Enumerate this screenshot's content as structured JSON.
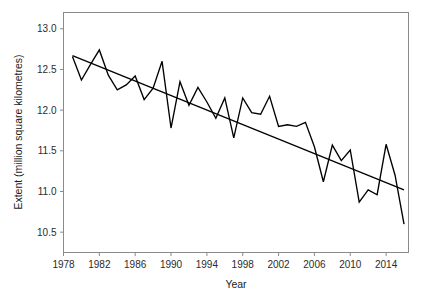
{
  "chart_data": {
    "type": "line",
    "title": "",
    "subtitle": "",
    "xlabel": "Year",
    "ylabel": "Extent (million square kilometres)",
    "xlim": [
      1978,
      2016.5
    ],
    "ylim": [
      10.25,
      13.2
    ],
    "xticks": [
      1978,
      1982,
      1986,
      1990,
      1994,
      1998,
      2002,
      2006,
      2010,
      2014
    ],
    "xtick_labels": [
      "1978",
      "1982",
      "1986",
      "1990",
      "1994",
      "1998",
      "2002",
      "2006",
      "2010",
      "2014"
    ],
    "yticks": [
      10.5,
      11.0,
      11.5,
      12.0,
      12.5,
      13.0
    ],
    "ytick_labels": [
      "10.5",
      "11.0",
      "11.5",
      "12.0",
      "12.5",
      "13.0"
    ],
    "grid": false,
    "legend": "none",
    "x": [
      1979,
      1980,
      1981,
      1982,
      1983,
      1984,
      1985,
      1986,
      1987,
      1988,
      1989,
      1990,
      1991,
      1992,
      1993,
      1994,
      1995,
      1996,
      1997,
      1998,
      1999,
      2000,
      2001,
      2002,
      2003,
      2004,
      2005,
      2006,
      2007,
      2008,
      2009,
      2010,
      2011,
      2012,
      2013,
      2014,
      2015,
      2016
    ],
    "series": [
      {
        "name": "Sea ice extent",
        "style": "zigzag-line",
        "color": "#000000",
        "values": [
          12.66,
          12.37,
          12.56,
          12.74,
          12.43,
          12.25,
          12.31,
          12.42,
          12.13,
          12.27,
          12.6,
          11.78,
          12.35,
          12.06,
          12.28,
          12.1,
          11.9,
          12.15,
          11.66,
          12.15,
          11.97,
          11.95,
          12.17,
          11.8,
          11.82,
          11.8,
          11.85,
          11.55,
          11.12,
          11.57,
          11.38,
          11.51,
          10.87,
          11.02,
          10.96,
          11.58,
          11.2,
          10.6
        ]
      },
      {
        "name": "Linear trend",
        "style": "straight-line",
        "color": "#000000",
        "endpoints": [
          [
            1979,
            12.67
          ],
          [
            2016,
            11.02
          ]
        ]
      }
    ]
  },
  "axes": {
    "y_axis_title": "Extent (million square kilometres)",
    "x_axis_title": "Year"
  }
}
